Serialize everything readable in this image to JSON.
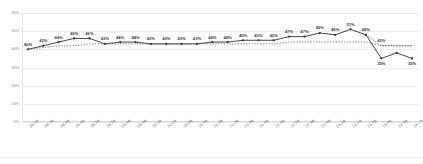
{
  "chart": {
    "title": "",
    "type": "line"
  },
  "chart_data": {
    "type": "line",
    "title": "",
    "subtitle": "",
    "xlabel": "",
    "ylabel": "",
    "ylim": [
      0,
      60
    ],
    "yticks": [
      "0%",
      "10%",
      "20%",
      "30%",
      "40%",
      "50%",
      "60%"
    ],
    "ytick_values": [
      0,
      10,
      20,
      30,
      40,
      50,
      60
    ],
    "grid": true,
    "legend": "none",
    "value_suffix": "%",
    "categories": [
      "18.1q",
      "18.2q",
      "18.3q",
      "18.4q",
      "19.1q",
      "19.2q",
      "19.3q",
      "19.4q",
      "20.1q",
      "20.2q",
      "20.3q",
      "20.4q",
      "21.1q",
      "21.2q",
      "21.3q",
      "21.4q",
      "22.1q",
      "22.2q",
      "22.3q",
      "22.4q",
      "23.1q",
      "23.2q",
      "23.3q",
      "23.4q",
      "24.1q",
      "24.2q"
    ],
    "series": [
      {
        "name": "actual",
        "style": "solid-line-with-markers",
        "values": [
          40,
          42,
          44,
          46,
          46,
          43,
          44,
          44,
          43,
          43,
          43,
          43,
          44,
          44,
          45,
          45,
          45,
          47,
          47,
          49,
          48,
          51,
          48,
          null,
          null,
          null
        ],
        "labels": [
          "40%",
          "42%",
          "44%",
          "46%",
          "46%",
          "43%",
          "44%",
          "44%",
          "43%",
          "43%",
          "43%",
          "43%",
          "44%",
          "44%",
          "45%",
          "45%",
          "45%",
          "47%",
          "47%",
          "49%",
          "48%",
          "51%",
          "48%",
          "",
          "",
          ""
        ]
      },
      {
        "name": "forecast-upper",
        "style": "dotted-line",
        "values": [
          null,
          null,
          null,
          null,
          null,
          null,
          null,
          null,
          null,
          null,
          null,
          null,
          null,
          null,
          null,
          null,
          null,
          null,
          null,
          null,
          null,
          null,
          48,
          42,
          42,
          42
        ],
        "labels": [
          "",
          "",
          "",
          "",
          "",
          "",
          "",
          "",
          "",
          "",
          "",
          "",
          "",
          "",
          "",
          "",
          "",
          "",
          "",
          "",
          "",
          "",
          "",
          "42%",
          "",
          ""
        ]
      },
      {
        "name": "forecast-lower",
        "style": "solid-line-with-markers",
        "values": [
          null,
          null,
          null,
          null,
          null,
          null,
          null,
          null,
          null,
          null,
          null,
          null,
          null,
          null,
          null,
          null,
          null,
          null,
          null,
          null,
          null,
          null,
          48,
          35,
          38,
          35
        ],
        "labels": [
          "",
          "",
          "",
          "",
          "",
          "",
          "",
          "",
          "",
          "",
          "",
          "",
          "",
          "",
          "",
          "",
          "",
          "",
          "",
          "",
          "",
          "",
          "",
          "35%",
          "",
          "35%"
        ]
      },
      {
        "name": "trend-baseline",
        "style": "dotted-line",
        "values": [
          40,
          41,
          42,
          42,
          43,
          43,
          43,
          43,
          43,
          43,
          43,
          43,
          43,
          43,
          43,
          43,
          43,
          44,
          44,
          44,
          44,
          44,
          44,
          42,
          42,
          42
        ],
        "labels": []
      }
    ],
    "colors": {
      "line": "#2f2f3a",
      "marker": "#2f2f3a",
      "dotted": "#4a4a58",
      "grid": "#e9e9ef",
      "axis": "#d9d9e1",
      "label_text": "#3a3a46",
      "tick_text": "#7a7a86"
    }
  }
}
